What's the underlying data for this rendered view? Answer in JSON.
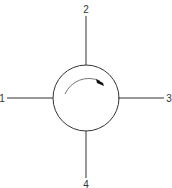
{
  "diagram": {
    "type": "four-port circulator symbol",
    "ports": [
      {
        "id": "port-1",
        "label": "1",
        "position": "left"
      },
      {
        "id": "port-2",
        "label": "2",
        "position": "top"
      },
      {
        "id": "port-3",
        "label": "3",
        "position": "right"
      },
      {
        "id": "port-4",
        "label": "4",
        "position": "bottom"
      }
    ],
    "rotation_arrow": "clockwise",
    "colors": {
      "line": "#333333",
      "background": "#ffffff"
    }
  }
}
